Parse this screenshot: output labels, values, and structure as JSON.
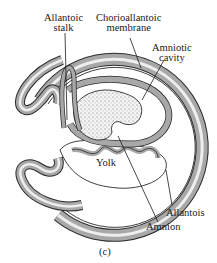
{
  "figure": {
    "panel_label": "(c)",
    "colors": {
      "outline": "#2a2a2a",
      "membrane_fill": "#a8a8a8",
      "membrane_highlight": "#e8e8e8",
      "embryo_stipple": "#cfcfcf",
      "background": "#ffffff"
    }
  },
  "labels": {
    "allantoic_stalk": {
      "line1": "Allantoic",
      "line2": "stalk"
    },
    "chorioallantoic_membrane": {
      "line1": "Chorioallantoic",
      "line2": "membrane"
    },
    "amniotic_cavity": {
      "line1": "Amniotic",
      "line2": "cavity"
    },
    "yolk": "Yolk",
    "allantois": "Allantois",
    "amnion": "Amnion"
  }
}
